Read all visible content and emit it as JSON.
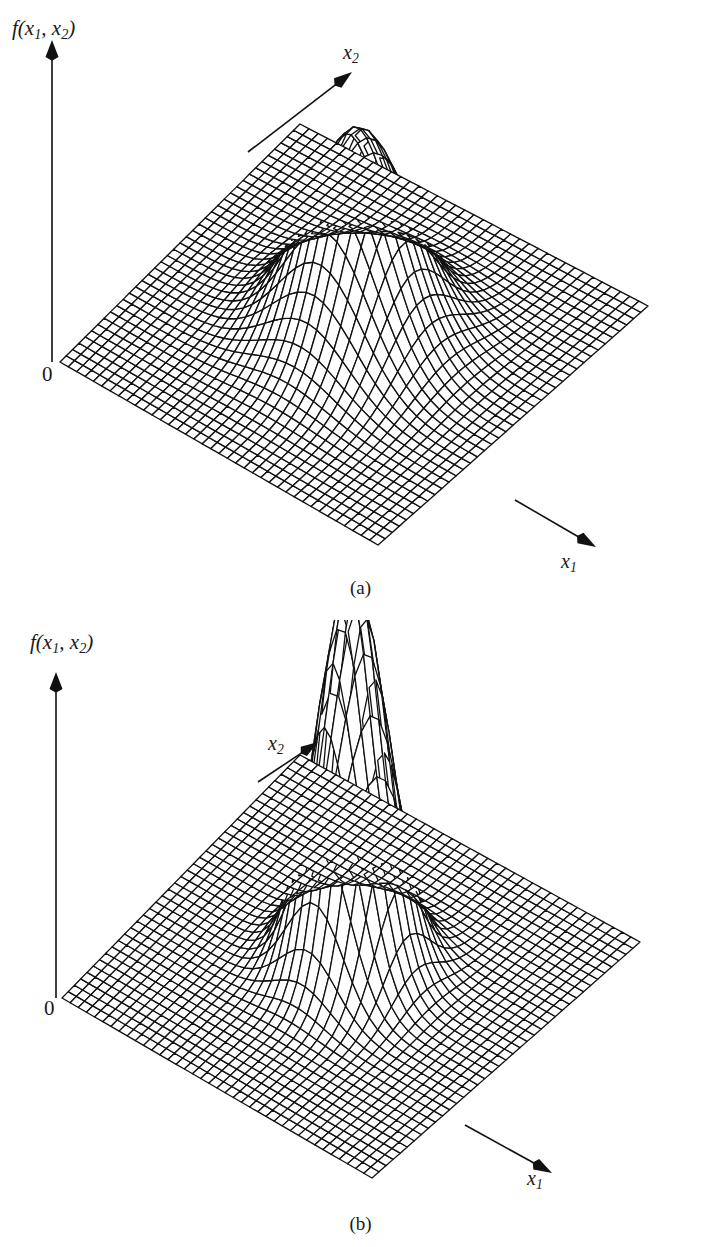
{
  "figure": {
    "background_color": "#ffffff",
    "ink_color": "#111111",
    "width": 721,
    "height": 1247,
    "panels": [
      {
        "id": "a",
        "caption": "(a)",
        "vertical_axis_label": "f(x",
        "vertical_axis_label_sub1": "1",
        "vertical_axis_label_mid": ", x",
        "vertical_axis_label_sub2": "2",
        "vertical_axis_label_end": ")",
        "x1_label": "x",
        "x1_label_sub": "1",
        "x2_label": "x",
        "x2_label_sub": "2",
        "origin_label": "0"
      },
      {
        "id": "b",
        "caption": "(b)",
        "vertical_axis_label": "f(x",
        "vertical_axis_label_sub1": "1",
        "vertical_axis_label_mid": ", x",
        "vertical_axis_label_sub2": "2",
        "vertical_axis_label_end": ")",
        "x1_label": "x",
        "x1_label_sub": "1",
        "x2_label": "x",
        "x2_label_sub": "2",
        "origin_label": "0"
      }
    ]
  },
  "chart_data": [
    {
      "type": "surface",
      "panel": "a",
      "title": "",
      "xlabel": "x_1",
      "ylabel": "x_2",
      "zlabel": "f(x_1, x_2)",
      "function": "bivariate gaussian",
      "grid": {
        "nx": 38,
        "ny": 38
      },
      "domain": {
        "u": [
          -3.4,
          3.4
        ],
        "v": [
          -3.4,
          3.4
        ]
      },
      "peak_amplitude": 1.0,
      "peak_center": [
        0.15,
        0.1
      ],
      "sigma": [
        0.86,
        0.86
      ],
      "peak_height_fraction_of_axis": 0.62,
      "description": "Broad bivariate normal density surface on a flat base plane, moderate peak height",
      "legend": "none",
      "annotations": [
        "0"
      ]
    },
    {
      "type": "surface",
      "panel": "b",
      "title": "",
      "xlabel": "x_1",
      "ylabel": "x_2",
      "zlabel": "f(x_1, x_2)",
      "function": "bivariate gaussian",
      "grid": {
        "nx": 38,
        "ny": 38
      },
      "domain": {
        "u": [
          -3.4,
          3.4
        ],
        "v": [
          -3.4,
          3.4
        ]
      },
      "peak_amplitude": 1.0,
      "peak_center": [
        0.1,
        0.1
      ],
      "sigma": [
        0.6,
        0.6
      ],
      "peak_height_fraction_of_axis": 1.18,
      "description": "Narrow, tall bivariate normal density surface whose peak rises above the x2 axis arrow",
      "legend": "none",
      "annotations": [
        "0"
      ]
    }
  ]
}
